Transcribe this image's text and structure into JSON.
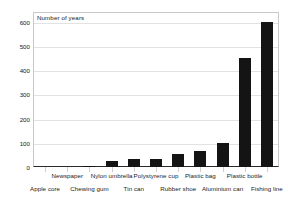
{
  "chart_data": {
    "type": "bar",
    "title": "",
    "subtitle": "",
    "xlabel": "",
    "ylabel": "Number of years",
    "ylim": [
      0,
      640
    ],
    "ytick_values": [
      0,
      100,
      200,
      300,
      400,
      500,
      600
    ],
    "ytick_labels": [
      "0",
      "100",
      "200",
      "300",
      "400",
      "500",
      "600"
    ],
    "grid": true,
    "legend": false,
    "legend_position": "none",
    "bar_color": "#141414",
    "categories": [
      "Apple core",
      "Newspaper",
      "Chewing gum",
      "Nylon umbrella",
      "Tin can",
      "Polystyrene cup",
      "Rubber shoe",
      "Plastic bag",
      "Aluminium can",
      "Plastic bottle",
      "Fishing line"
    ],
    "values": [
      0,
      0,
      5,
      25,
      35,
      35,
      55,
      65,
      100,
      450,
      600
    ],
    "label_rows": [
      "bottom",
      "top",
      "bottom",
      "top",
      "bottom",
      "top",
      "bottom",
      "top",
      "bottom",
      "top",
      "bottom"
    ]
  },
  "axis": {
    "y_title": "Number of years"
  }
}
